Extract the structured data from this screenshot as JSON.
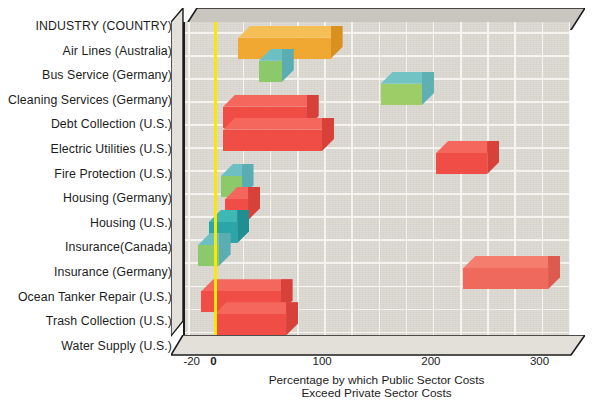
{
  "chart_data": {
    "type": "bar",
    "orientation": "horizontal",
    "title": "",
    "header_label": "INDUSTRY (COUNTRY)",
    "xlabel_lines": [
      "Percentage by which Public Sector Costs",
      "Exceed Private Sector Costs"
    ],
    "ylabel": "",
    "xlim": [
      -28,
      328
    ],
    "xticks": [
      -20,
      0,
      100,
      200,
      300
    ],
    "xticklabels": [
      "-20",
      "0",
      "100",
      "200",
      "300"
    ],
    "grid": true,
    "grid_spacing": 25,
    "zero_line_color": "#fbe800",
    "plot_background": "#dedbd4",
    "legend": "none",
    "categories": [
      "Air Lines (Australia)",
      "Bus Service (Germany)",
      "Cleaning Services (Germany)",
      "Debt Collection (U.S.)",
      "Electric Utilities (U.S.)",
      "Fire Protection (U.S.)",
      "Housing (Germany)",
      "Housing (U.S.)",
      "Insurance(Canada)",
      "Insurance (Germany)",
      "Ocean Tanker Repair (U.S.)",
      "Trash Collection (U.S.)",
      "Water Supply (U.S.)"
    ],
    "bars": [
      {
        "category": "Air Lines (Australia)",
        "start": 21,
        "end": 106,
        "color": "#f0a833",
        "top": "#f6bf55",
        "side": "#d9901f"
      },
      {
        "category": "Bus Service (Germany)",
        "start": 40,
        "end": 61,
        "color": "#8cc96a",
        "top": "#6cc0c2",
        "side": "#5aadb0"
      },
      {
        "category": "Cleaning Services (Germany)",
        "start": 152,
        "end": 190,
        "color": "#9ccd66",
        "top": "#71c3c4",
        "side": "#5fb0b2"
      },
      {
        "category": "Debt Collection (U.S.)",
        "start": 7,
        "end": 84,
        "color": "#ef4d45",
        "top": "#f5675d",
        "side": "#d8403a"
      },
      {
        "category": "Electric Utilities (U.S.)",
        "start": 7,
        "end": 98,
        "color": "#ef4d45",
        "top": "#f5675d",
        "side": "#d8403a"
      },
      {
        "category": "Fire Protection (U.S.)",
        "start": 203,
        "end": 250,
        "color": "#ef4d45",
        "top": "#f5675d",
        "side": "#d8403a"
      },
      {
        "category": "Housing (Germany)",
        "start": 5,
        "end": 24,
        "color": "#8cc96a",
        "top": "#6cc0c2",
        "side": "#5aadb0"
      },
      {
        "category": "Housing (U.S.)",
        "start": 9,
        "end": 30,
        "color": "#ef4d45",
        "top": "#f5675d",
        "side": "#d8403a"
      },
      {
        "category": "Insurance(Canada)",
        "start": -6,
        "end": 20,
        "color": "#2aa5a8",
        "top": "#3fb7b5",
        "side": "#1f8f93"
      },
      {
        "category": "Insurance (Germany)",
        "start": -16,
        "end": 3,
        "color": "#8cc96a",
        "top": "#6cc0c2",
        "side": "#5aadb0"
      },
      {
        "category": "Ocean Tanker Repair (U.S.)",
        "start": 228,
        "end": 306,
        "color": "#ef6a5c",
        "top": "#f47d6d",
        "side": "#dc5b4e"
      },
      {
        "category": "Trash Collection (U.S.)",
        "start": -13,
        "end": 60,
        "color": "#ef4d45",
        "top": "#f5675d",
        "side": "#d8403a"
      },
      {
        "category": "Water Supply (U.S.)",
        "start": -1,
        "end": 65,
        "color": "#ef4d45",
        "top": "#f5675d",
        "side": "#d8403a"
      }
    ]
  }
}
